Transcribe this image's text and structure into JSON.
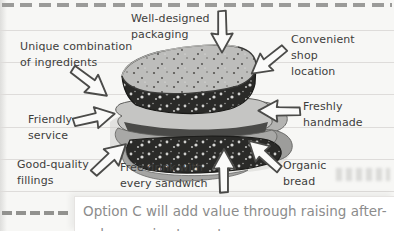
{
  "colors": {
    "page_bg": "#f7f7f5",
    "rule_line": "#dedcda",
    "label_text": "#3e3e3c",
    "caption_text": "#8c8c8c",
    "arrow_fill": "#fafaf9",
    "arrow_stroke": "#4b4b49",
    "dash_color": "#9b9b99"
  },
  "diagram": {
    "illustration": "hand-drawn sandwich (grayscale, speckled bread with lettuce filling)",
    "labels": [
      {
        "id": "packaging",
        "lines": [
          "Well-designed",
          "packaging"
        ],
        "arrow": "down"
      },
      {
        "id": "ingredients",
        "lines": [
          "Unique combination",
          "of ingredients"
        ],
        "arrow": "down-right"
      },
      {
        "id": "shop",
        "lines": [
          "Convenient",
          "shop",
          "location"
        ],
        "arrow": "down-left"
      },
      {
        "id": "friendly",
        "lines": [
          "Friendly",
          "service"
        ],
        "arrow": "right"
      },
      {
        "id": "freshly",
        "lines": [
          "Freshly",
          "handmade"
        ],
        "arrow": "left"
      },
      {
        "id": "fillings",
        "lines": [
          "Good-quality",
          "fillings"
        ],
        "arrow": "up-right"
      },
      {
        "id": "drink",
        "lines": [
          "Free drink with",
          "every sandwich"
        ],
        "arrow": "up"
      },
      {
        "id": "bread",
        "lines": [
          "Organic",
          "bread"
        ],
        "arrow": "up-left"
      }
    ]
  },
  "caption": {
    "text": "Option C will add value through raising after-",
    "next_line_partial": "sales service to customers"
  }
}
